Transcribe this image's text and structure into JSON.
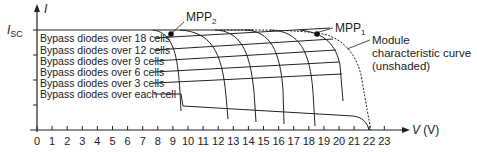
{
  "chart_data": {
    "type": "line",
    "title": "",
    "xlabel": "V (V)",
    "ylabel": "I",
    "y_marker_label": "I_SC",
    "x_ticks": [
      0,
      1,
      2,
      3,
      4,
      5,
      6,
      7,
      8,
      9,
      10,
      11,
      12,
      13,
      14,
      15,
      16,
      17,
      18,
      19,
      20,
      21,
      22,
      23
    ],
    "xlim": [
      0,
      23
    ],
    "grid": false,
    "series": [
      {
        "name": "Module characteristic curve (unshaded)",
        "style": "dotted",
        "points": [
          [
            0,
            1.0
          ],
          [
            14,
            1.0
          ],
          [
            17,
            0.98
          ],
          [
            18.8,
            0.93
          ],
          [
            20,
            0.84
          ],
          [
            21,
            0.68
          ],
          [
            21.7,
            0.42
          ],
          [
            22.2,
            0.0
          ]
        ]
      },
      {
        "name": "Partially shaded module envelope",
        "style": "solid",
        "points": [
          [
            0,
            1.0
          ],
          [
            8.5,
            1.0
          ],
          [
            9,
            0.97
          ],
          [
            10,
            0.75
          ],
          [
            10.5,
            0.4
          ],
          [
            10.6,
            0.3
          ],
          [
            22,
            0.15
          ],
          [
            22.3,
            0.0
          ]
        ]
      },
      {
        "name": "Bypass diodes over 18 cells",
        "style": "solid",
        "label_row": 1
      },
      {
        "name": "Bypass diodes over 12 cells",
        "style": "solid",
        "label_row": 2
      },
      {
        "name": "Bypass diodes over 9 cells",
        "style": "solid",
        "label_row": 3
      },
      {
        "name": "Bypass diodes over 6 cells",
        "style": "solid",
        "label_row": 4
      },
      {
        "name": "Bypass diodes over 3 cells",
        "style": "solid",
        "label_row": 5
      },
      {
        "name": "Bypass diodes over each cell",
        "style": "solid",
        "label_row": 6
      }
    ],
    "annotations": [
      {
        "text": "MPP2",
        "x": 9.0,
        "y": 0.97
      },
      {
        "text": "MPP1",
        "x": 18.8,
        "y": 0.93
      },
      {
        "text": "Module characteristic curve (unshaded)",
        "x": 20.8,
        "y": 0.8
      }
    ]
  },
  "labels": {
    "y_axis": "I",
    "isc": "I",
    "isc_sub": "SC",
    "x_axis": "V (V)",
    "mpp2": "MPP",
    "mpp2_sub": "2",
    "mpp1": "MPP",
    "mpp1_sub": "1",
    "module_line1": "Module",
    "module_line2": "characteristic curve",
    "module_line3": "(unshaded)",
    "bypass": [
      "Bypass diodes over 18 cells",
      "Bypass diodes over 12 cells",
      "Bypass diodes over 9 cells",
      "Bypass diodes over 6 cells",
      "Bypass diodes over 3 cells",
      "Bypass diodes over each cell"
    ],
    "ticks": [
      "0",
      "1",
      "2",
      "3",
      "4",
      "5",
      "6",
      "7",
      "8",
      "9",
      "10",
      "11",
      "12",
      "13",
      "14",
      "15",
      "16",
      "17",
      "18",
      "19",
      "20",
      "21",
      "22",
      "23"
    ]
  }
}
